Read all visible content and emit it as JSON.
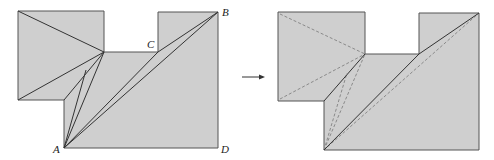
{
  "diagram": {
    "colors": {
      "fill": "#cfcfcf",
      "outline": "#555555",
      "crease_solid": "#333333",
      "crease_dashed": "#8a8a8a",
      "background": "#ffffff"
    },
    "left_figure": {
      "labels": {
        "A": "A",
        "B": "B",
        "C": "C",
        "D": "D"
      }
    },
    "arrow": {
      "direction": "right"
    }
  }
}
